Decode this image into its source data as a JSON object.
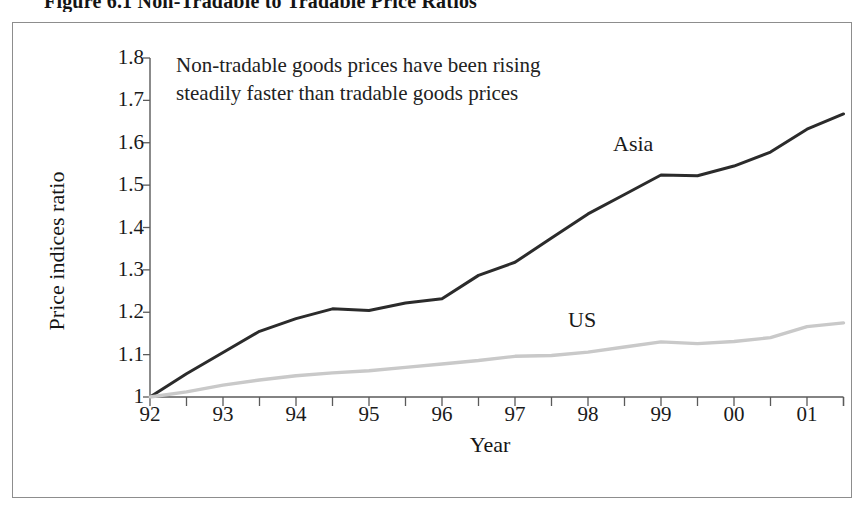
{
  "figure": {
    "title": "Figure 6.1  Non-Tradable to Tradable Price  Ratios"
  },
  "annotation": {
    "line1": "Non-tradable goods prices have been rising",
    "line2": "steadily faster than tradable goods prices"
  },
  "labels": {
    "asia": "Asia",
    "us": "US"
  },
  "colors": {
    "asia_line": "#2b2b2b",
    "us_line": "#c9c9c9",
    "axis": "#5a5a5a",
    "frame": "#8d8d8d",
    "text": "#1a1a1a",
    "background": "#ffffff"
  },
  "chart_data": {
    "type": "line",
    "title": "Figure 6.1  Non-Tradable to Tradable Price  Ratios",
    "xlabel": "Year",
    "ylabel": "Price indices ratio",
    "xlim": [
      1992,
      2001.5
    ],
    "ylim": [
      1.0,
      1.8
    ],
    "yticks": [
      1,
      1.1,
      1.2,
      1.3,
      1.4,
      1.5,
      1.6,
      1.7,
      1.8
    ],
    "ytick_labels": [
      "1",
      "1.1",
      "1.2",
      "1.3",
      "1.4",
      "1.5",
      "1.6",
      "1.7",
      "1.8"
    ],
    "xticks": [
      1992,
      1993,
      1994,
      1995,
      1996,
      1997,
      1998,
      1999,
      2000,
      2001
    ],
    "xtick_labels": [
      "92",
      "93",
      "94",
      "95",
      "96",
      "97",
      "98",
      "99",
      "00",
      "01"
    ],
    "minor_xticks_per_interval": 1,
    "grid": false,
    "legend": "inline-labels",
    "annotations": [
      {
        "text": "Non-tradable goods prices have been rising steadily faster than tradable goods prices",
        "x": 1992.4,
        "y": 1.77
      },
      {
        "text": "Asia",
        "x": 1998.4,
        "y": 1.59
      },
      {
        "text": "US",
        "x": 1997.7,
        "y": 1.22
      }
    ],
    "x": [
      1992.0,
      1992.5,
      1993.0,
      1993.5,
      1994.0,
      1994.5,
      1995.0,
      1995.5,
      1996.0,
      1996.5,
      1997.0,
      1997.5,
      1998.0,
      1998.5,
      1999.0,
      1999.5,
      2000.0,
      2000.5,
      2001.0,
      2001.5
    ],
    "series": [
      {
        "name": "Asia",
        "color": "#2b2b2b",
        "values": [
          1.0,
          1.055,
          1.105,
          1.155,
          1.185,
          1.208,
          1.204,
          1.222,
          1.232,
          1.287,
          1.318,
          1.375,
          1.432,
          1.478,
          1.524,
          1.522,
          1.545,
          1.578,
          1.632,
          1.668
        ]
      },
      {
        "name": "US",
        "color": "#c9c9c9",
        "values": [
          1.0,
          1.012,
          1.028,
          1.04,
          1.05,
          1.057,
          1.062,
          1.07,
          1.078,
          1.086,
          1.096,
          1.098,
          1.106,
          1.118,
          1.13,
          1.126,
          1.131,
          1.14,
          1.166,
          1.175
        ]
      }
    ]
  }
}
